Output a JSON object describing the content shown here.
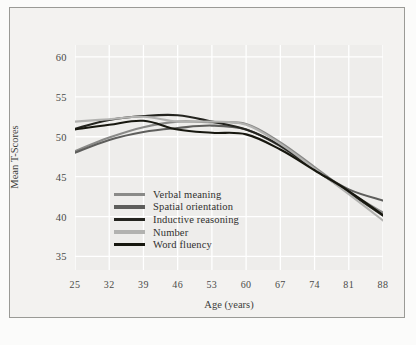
{
  "figure": {
    "annotation": "Total Sample"
  },
  "chart_data": {
    "type": "line",
    "title": "",
    "annotation": "Total Sample",
    "xlabel": "Age (years)",
    "ylabel": "Mean T-Scores",
    "x": [
      25,
      32,
      39,
      46,
      53,
      60,
      67,
      74,
      81,
      88
    ],
    "xticklabels": [
      "25",
      "32",
      "39",
      "46",
      "53",
      "60",
      "67",
      "74",
      "81",
      "88"
    ],
    "yticklabels": [
      "60",
      "55",
      "50",
      "45",
      "40",
      "35"
    ],
    "yticks": [
      60,
      55,
      50,
      45,
      40,
      35
    ],
    "xlim": [
      25,
      88
    ],
    "ylim": [
      33.3,
      61.5
    ],
    "grid": true,
    "legend_position": "center-left",
    "series": [
      {
        "name": "Verbal meaning",
        "color": "#8a8a88",
        "values": [
          48.2,
          49.9,
          51.2,
          51.9,
          51.8,
          51.6,
          49.3,
          46.2,
          43.1,
          40.5
        ]
      },
      {
        "name": "Spatial orientation",
        "color": "#5e5e5c",
        "values": [
          48.0,
          49.6,
          50.6,
          51.1,
          51.4,
          50.9,
          48.8,
          45.9,
          43.4,
          42.0
        ]
      },
      {
        "name": "Inductive reasoning",
        "color": "#24241f",
        "values": [
          51.0,
          52.1,
          52.6,
          52.7,
          51.9,
          50.9,
          48.9,
          45.9,
          43.0,
          40.1
        ]
      },
      {
        "name": "Number",
        "color": "#b2b2b0",
        "values": [
          51.9,
          52.2,
          52.5,
          51.9,
          51.9,
          51.5,
          49.1,
          46.0,
          42.8,
          39.5
        ]
      },
      {
        "name": "Word fluency",
        "color": "#17170f",
        "values": [
          50.9,
          51.5,
          52.0,
          50.9,
          50.5,
          50.3,
          48.4,
          45.8,
          43.2,
          40.2
        ]
      }
    ]
  }
}
